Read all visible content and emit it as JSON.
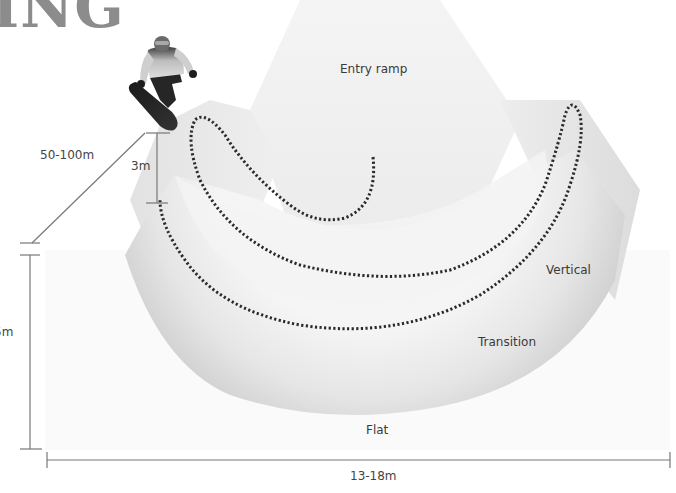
{
  "diagram": {
    "title_fragment": "ING",
    "zones": {
      "entry_ramp": "Entry ramp",
      "vertical": "Vertical",
      "transition": "Transition",
      "flat": "Flat"
    },
    "dimensions": {
      "pipe_length": "50-100m",
      "vertical_height": "3m",
      "wall_height": "5m",
      "pipe_width": "13-18m"
    },
    "icons": {
      "snowboarder": "snowboarder-figure",
      "rider_path": "dotted-rider-path"
    },
    "colors": {
      "background": "#ffffff",
      "pipe_light": "#f1f1f1",
      "pipe_shade": "#d6d6d6",
      "path": "#2a2a2a",
      "dimension_line": "#777777",
      "title": "#8c8c8c"
    }
  }
}
